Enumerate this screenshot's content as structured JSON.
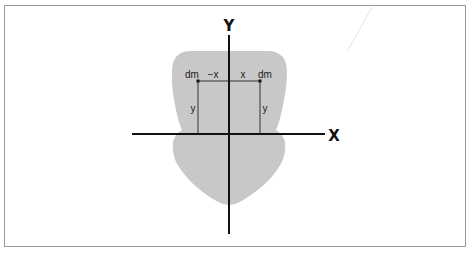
{
  "diagram": {
    "axes": {
      "x_label": "X",
      "y_label": "Y"
    },
    "points": {
      "left": {
        "label": "dm",
        "x_label": "−x",
        "y_label": "y"
      },
      "right": {
        "label": "dm",
        "x_label": "x",
        "y_label": "y"
      }
    },
    "colors": {
      "shape_fill": "#c8c8c8",
      "axis": "#111111",
      "guide_lines": "#333333",
      "frame_border": "#9a9a9a"
    }
  }
}
